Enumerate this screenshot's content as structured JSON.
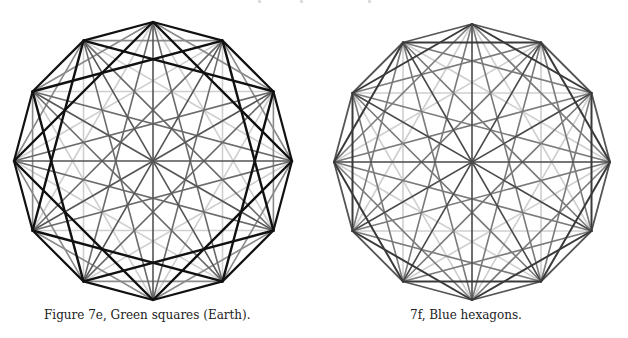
{
  "figures": [
    {
      "id": "7e",
      "caption": "Figure 7e, Green squares (Earth).",
      "center": [
        153,
        161
      ],
      "radius": 139,
      "vertices": 12,
      "highlight": "squares",
      "chord_styles": {
        "1": {
          "color": "#111111",
          "width": 2.2
        },
        "2": {
          "color": "#8a8a8a",
          "width": 1.6
        },
        "3": {
          "color": "#111111",
          "width": 2.4
        },
        "4": {
          "color": "#cfcfcf",
          "width": 1.6
        },
        "5": {
          "color": "#6a6a6a",
          "width": 1.6
        },
        "6": {
          "color": "#555555",
          "width": 1.6
        }
      },
      "caption_pos": [
        44,
        308
      ]
    },
    {
      "id": "7f",
      "caption": "7f, Blue hexagons.",
      "center": [
        472,
        162
      ],
      "radius": 138,
      "vertices": 12,
      "highlight": "hexagons",
      "chord_styles": {
        "1": {
          "color": "#555555",
          "width": 1.8
        },
        "2": {
          "color": "#3a3a3a",
          "width": 2.0
        },
        "3": {
          "color": "#7a7a7a",
          "width": 1.6
        },
        "4": {
          "color": "#cfcfcf",
          "width": 1.6
        },
        "5": {
          "color": "#7a7a7a",
          "width": 1.6
        },
        "6": {
          "color": "#4a4a4a",
          "width": 1.6
        }
      },
      "caption_pos": [
        410,
        308
      ]
    }
  ],
  "clipped_text_fragments_x": [
    258,
    300,
    368
  ]
}
